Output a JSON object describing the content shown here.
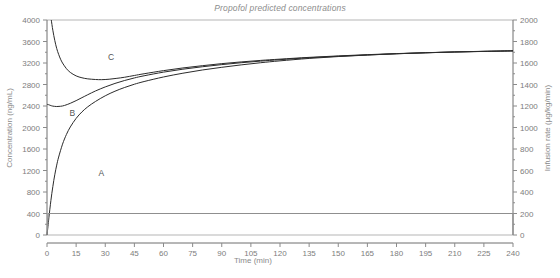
{
  "chart_data": {
    "type": "line",
    "title": "Propofol predicted concentrations",
    "xlabel": "Time (min)",
    "ylabel": "Concentration (ng/mL)",
    "y2label": "Infusion rate (µg/kg/min)",
    "xlim": [
      0,
      240
    ],
    "ylim": [
      0,
      4000
    ],
    "y2lim": [
      0,
      2000
    ],
    "grid": false,
    "legend": "inline-curve-labels",
    "xticks": [
      0,
      15,
      30,
      45,
      60,
      75,
      90,
      105,
      120,
      135,
      150,
      165,
      180,
      195,
      210,
      225,
      240
    ],
    "yticks": [
      0,
      400,
      800,
      1200,
      1600,
      2000,
      2400,
      2800,
      3200,
      3600,
      4000
    ],
    "y2ticks": [
      0,
      200,
      400,
      600,
      800,
      1000,
      1200,
      1400,
      1600,
      1800,
      2000
    ],
    "series": [
      {
        "name": "A",
        "label": "A",
        "label_x": 28,
        "label_y": 1100,
        "color": "#2b2b2b",
        "x": [
          0,
          0.5,
          1,
          2,
          3,
          4,
          5,
          6,
          8,
          10,
          12,
          15,
          18,
          21,
          25,
          30,
          35,
          40,
          45,
          50,
          60,
          70,
          80,
          90,
          100,
          110,
          120,
          135,
          150,
          165,
          180,
          195,
          210,
          225,
          240
        ],
        "y": [
          0,
          160,
          330,
          640,
          900,
          1120,
          1300,
          1450,
          1690,
          1870,
          2010,
          2170,
          2290,
          2385,
          2485,
          2590,
          2675,
          2745,
          2805,
          2855,
          2940,
          3010,
          3070,
          3120,
          3165,
          3205,
          3240,
          3285,
          3320,
          3348,
          3372,
          3390,
          3405,
          3415,
          3425
        ]
      },
      {
        "name": "B",
        "label": "B",
        "label_x": 13,
        "label_y": 2220,
        "color": "#2b2b2b",
        "x": [
          0,
          0.5,
          1,
          2,
          3,
          5,
          7,
          9,
          12,
          15,
          18,
          21,
          25,
          30,
          35,
          40,
          45,
          50,
          60,
          70,
          80,
          90,
          100,
          110,
          120,
          135,
          150,
          165,
          180,
          195,
          210,
          225,
          240
        ],
        "y": [
          2430,
          2428,
          2422,
          2408,
          2398,
          2390,
          2395,
          2410,
          2450,
          2500,
          2555,
          2610,
          2680,
          2755,
          2820,
          2875,
          2922,
          2962,
          3030,
          3085,
          3130,
          3170,
          3205,
          3235,
          3262,
          3298,
          3325,
          3350,
          3372,
          3390,
          3405,
          3416,
          3426
        ]
      },
      {
        "name": "C",
        "label": "C",
        "label_x": 33,
        "label_y": 3260,
        "color": "#2b2b2b",
        "x": [
          2.2,
          3,
          4,
          5,
          6,
          7,
          8,
          10,
          12,
          15,
          18,
          21,
          25,
          28,
          32,
          36,
          40,
          45,
          50,
          60,
          70,
          80,
          90,
          100,
          110,
          120,
          135,
          150,
          165,
          180,
          195,
          210,
          225,
          240
        ],
        "y": [
          4000,
          3810,
          3620,
          3470,
          3360,
          3270,
          3200,
          3095,
          3025,
          2960,
          2925,
          2905,
          2893,
          2890,
          2898,
          2915,
          2935,
          2968,
          3000,
          3058,
          3108,
          3150,
          3188,
          3220,
          3248,
          3272,
          3305,
          3332,
          3355,
          3375,
          3392,
          3406,
          3418,
          3428
        ]
      }
    ],
    "infusion": {
      "name": "infusion-rate",
      "color": "#8f8f8f",
      "unit": "µg/kg/min",
      "rate": 200,
      "start_time": 0,
      "stop_time": 240,
      "x": [
        0,
        0.6,
        1.2,
        240,
        240.5
      ],
      "y2": [
        0,
        200,
        200,
        200,
        0
      ]
    }
  }
}
